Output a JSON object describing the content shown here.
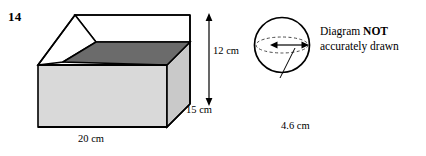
{
  "question": {
    "number": "14"
  },
  "diagrams": {
    "cuboid": {
      "name": "open-top rectangular box",
      "labels": {
        "width": "20 cm",
        "depth": "15 cm",
        "height": "12 cm"
      },
      "measurements": {
        "width_cm": 20,
        "depth_cm": 15,
        "height_cm": 12
      },
      "colors": {
        "outer_face": "#d9d9d9",
        "right_face": "#c9c9c9",
        "inner_bottom": "#6b6b6b",
        "inner_back": "#ffffff",
        "outline": "#000000"
      }
    },
    "sphere": {
      "name": "sphere with radius arrow",
      "labels": {
        "radius": "4.6 cm"
      },
      "measurements": {
        "radius_cm": 4.6
      },
      "colors": {
        "outline": "#000000",
        "equator_dash": "#555555"
      }
    }
  },
  "notice": {
    "line1_prefix": "Diagram ",
    "line1_emphasis": "NOT",
    "line2": "accurately drawn"
  }
}
